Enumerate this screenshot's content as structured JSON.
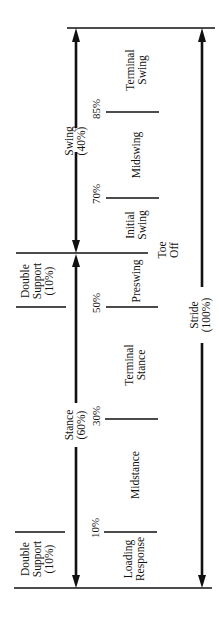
{
  "diagram": {
    "type": "gait-cycle-timeline",
    "orientation": "rotated -90deg (time runs bottom to top)",
    "periods": [
      {
        "name": "swing",
        "label_line1": "Swing",
        "label_line2": "(40%)"
      },
      {
        "name": "stance",
        "label_line1": "Stance",
        "label_line2": "(60%)"
      }
    ],
    "stride": {
      "label_line1": "Stride",
      "label_line2": "(100%)"
    },
    "double_support_upper": {
      "line1": "Double",
      "line2": "Support",
      "line3": "(10%)"
    },
    "double_support_lower": {
      "line1": "Double",
      "line2": "Support",
      "line3": "(10%)"
    },
    "toe_off": {
      "line1": "Toe",
      "line2": "Off"
    },
    "phases": [
      {
        "line1": "Terminal",
        "line2": "Swing"
      },
      {
        "line1": "Midswing",
        "line2": ""
      },
      {
        "line1": "Initial",
        "line2": "Swing"
      },
      {
        "line1": "Preswing",
        "line2": ""
      },
      {
        "line1": "Terminal",
        "line2": "Stance"
      },
      {
        "line1": "Midstance",
        "line2": ""
      },
      {
        "line1": "Loading",
        "line2": "Response"
      }
    ],
    "percent_markers": [
      "85%",
      "70%",
      "50%",
      "30%",
      "10%"
    ]
  }
}
